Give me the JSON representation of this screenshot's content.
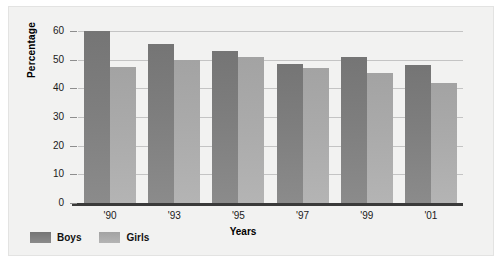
{
  "chart_data": {
    "type": "bar",
    "title": "",
    "xlabel": "Years",
    "ylabel": "Percentage",
    "categories": [
      "'90",
      "'93",
      "'95",
      "'97",
      "'99",
      "'01"
    ],
    "series": [
      {
        "name": "Boys",
        "color": "#7e7e7e",
        "values": [
          60,
          55.5,
          53,
          48.5,
          51,
          48
        ]
      },
      {
        "name": "Girls",
        "color": "#aaaaaa",
        "values": [
          47.5,
          50,
          51,
          47,
          45.5,
          42
        ]
      }
    ],
    "ylim": [
      0,
      60
    ],
    "ytick_values": [
      0,
      10,
      20,
      30,
      40,
      50,
      60
    ],
    "ytick_labels": [
      "0",
      "10",
      "20",
      "30",
      "40",
      "50",
      "60"
    ],
    "grid": true,
    "legend_position": "bottom-left"
  },
  "legend": {
    "entries": [
      {
        "label": "Boys",
        "swatch": "boys-swatch-icon"
      },
      {
        "label": "Girls",
        "swatch": "girls-swatch-icon"
      }
    ]
  }
}
